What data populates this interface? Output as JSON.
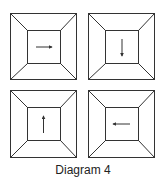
{
  "caption": "Diagram 4",
  "colors": {
    "stroke": "#333333",
    "background": "#ffffff"
  },
  "panels": [
    {
      "position": "top-left",
      "arrow_direction": "right"
    },
    {
      "position": "top-right",
      "arrow_direction": "down"
    },
    {
      "position": "bottom-left",
      "arrow_direction": "up"
    },
    {
      "position": "bottom-right",
      "arrow_direction": "left"
    }
  ]
}
